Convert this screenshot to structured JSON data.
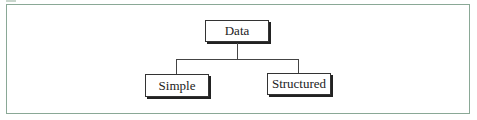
{
  "diagram": {
    "type": "tree",
    "root": {
      "label": "Data"
    },
    "children": [
      {
        "label": "Simple"
      },
      {
        "label": "Structured"
      }
    ]
  }
}
